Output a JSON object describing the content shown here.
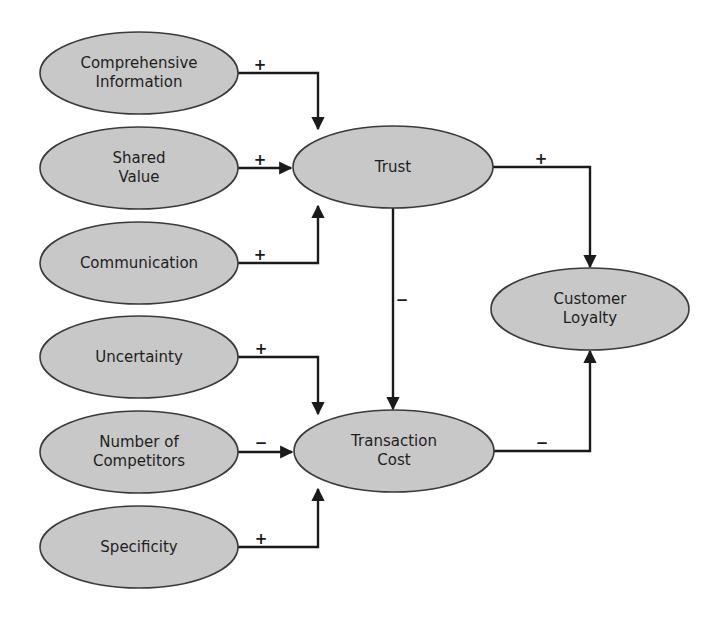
{
  "diagram": {
    "type": "causal-model",
    "colors": {
      "node_fill": "#c8c8c8",
      "node_stroke": "#3a3a3a",
      "edge": "#1a1a1a",
      "text": "#1e1e1e",
      "background": "#ffffff"
    },
    "nodes": [
      {
        "id": "comprehensive-information",
        "lines": [
          "Comprehensive",
          "Information"
        ],
        "cx": 139,
        "cy": 73,
        "rx": 99,
        "ry": 41
      },
      {
        "id": "shared-value",
        "lines": [
          "Shared",
          "Value"
        ],
        "cx": 139,
        "cy": 168,
        "rx": 99,
        "ry": 41
      },
      {
        "id": "communication",
        "lines": [
          "Communication"
        ],
        "cx": 139,
        "cy": 263,
        "rx": 99,
        "ry": 41
      },
      {
        "id": "uncertainty",
        "lines": [
          "Uncertainty"
        ],
        "cx": 139,
        "cy": 357,
        "rx": 99,
        "ry": 41
      },
      {
        "id": "number-of-competitors",
        "lines": [
          "Number of",
          "Competitors"
        ],
        "cx": 139,
        "cy": 452,
        "rx": 99,
        "ry": 41
      },
      {
        "id": "specificity",
        "lines": [
          "Specificity"
        ],
        "cx": 139,
        "cy": 547,
        "rx": 99,
        "ry": 41
      },
      {
        "id": "trust",
        "lines": [
          "Trust"
        ],
        "cx": 393,
        "cy": 167,
        "rx": 100,
        "ry": 41
      },
      {
        "id": "transaction-cost",
        "lines": [
          "Transaction",
          "Cost"
        ],
        "cx": 394,
        "cy": 451,
        "rx": 100,
        "ry": 41
      },
      {
        "id": "customer-loyalty",
        "lines": [
          "Customer",
          "Loyalty"
        ],
        "cx": 590,
        "cy": 309,
        "rx": 99,
        "ry": 41
      }
    ],
    "edges": [
      {
        "from": "comprehensive-information",
        "to": "trust",
        "sign": "+",
        "points": [
          [
            238,
            73
          ],
          [
            318,
            73
          ],
          [
            318,
            129
          ]
        ],
        "sign_pos": [
          260,
          65
        ]
      },
      {
        "from": "shared-value",
        "to": "trust",
        "sign": "+",
        "points": [
          [
            238,
            168
          ],
          [
            291,
            168
          ]
        ],
        "sign_pos": [
          260,
          160
        ]
      },
      {
        "from": "communication",
        "to": "trust",
        "sign": "+",
        "points": [
          [
            238,
            263
          ],
          [
            318,
            263
          ],
          [
            318,
            206
          ]
        ],
        "sign_pos": [
          260,
          255
        ]
      },
      {
        "from": "trust",
        "to": "transaction-cost",
        "sign": "−",
        "points": [
          [
            393,
            208
          ],
          [
            393,
            409
          ]
        ],
        "sign_pos": [
          402,
          300
        ]
      },
      {
        "from": "trust",
        "to": "customer-loyalty",
        "sign": "+",
        "points": [
          [
            493,
            167
          ],
          [
            590,
            167
          ],
          [
            590,
            267
          ]
        ],
        "sign_pos": [
          541,
          159
        ]
      },
      {
        "from": "uncertainty",
        "to": "transaction-cost",
        "sign": "+",
        "points": [
          [
            238,
            357
          ],
          [
            318,
            357
          ],
          [
            318,
            414
          ]
        ],
        "sign_pos": [
          261,
          349
        ]
      },
      {
        "from": "number-of-competitors",
        "to": "transaction-cost",
        "sign": "−",
        "points": [
          [
            238,
            452
          ],
          [
            292,
            452
          ]
        ],
        "sign_pos": [
          261,
          443
        ]
      },
      {
        "from": "specificity",
        "to": "transaction-cost",
        "sign": "+",
        "points": [
          [
            238,
            547
          ],
          [
            318,
            547
          ],
          [
            318,
            489
          ]
        ],
        "sign_pos": [
          261,
          539
        ]
      },
      {
        "from": "transaction-cost",
        "to": "customer-loyalty",
        "sign": "−",
        "points": [
          [
            494,
            451
          ],
          [
            590,
            451
          ],
          [
            590,
            351
          ]
        ],
        "sign_pos": [
          542,
          443
        ]
      }
    ]
  }
}
